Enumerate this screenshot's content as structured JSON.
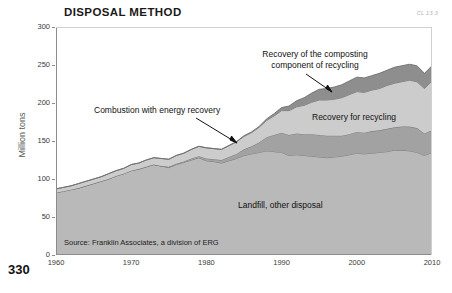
{
  "figure": {
    "title": "DISPOSAL METHOD",
    "code": "CL 13.3",
    "page_number": "330",
    "source_note": "Source: Franklin Associates, a division of ERG"
  },
  "annotations": {
    "composting_line1": "Recovery of the composting",
    "composting_line2": "component of recycling",
    "combustion": "Combustion with energy recovery",
    "recycling": "Recovery for recycling",
    "landfill": "Landfill, other disposal"
  },
  "colors": {
    "landfill": "#b9b9b9",
    "combustion": "#a2a2a2",
    "recycling": "#cccccc",
    "composting": "#8e8e8e",
    "line": "#6e6e6e",
    "axis": "#8c8c8c",
    "text": "#111111"
  },
  "chart_data": {
    "type": "area",
    "title": "DISPOSAL METHOD",
    "xlabel": "",
    "ylabel": "Million tons",
    "xlim": [
      1960,
      2010
    ],
    "ylim": [
      0,
      300
    ],
    "yticks": [
      0,
      50,
      100,
      150,
      200,
      250,
      300
    ],
    "xticks": [
      1960,
      1970,
      1980,
      1990,
      2000,
      2010
    ],
    "grid": false,
    "legend_position": "inline-annotations",
    "stacked": true,
    "x": [
      1960,
      1961,
      1962,
      1963,
      1964,
      1965,
      1966,
      1967,
      1968,
      1969,
      1970,
      1971,
      1972,
      1973,
      1974,
      1975,
      1976,
      1977,
      1978,
      1979,
      1980,
      1981,
      1982,
      1983,
      1984,
      1985,
      1986,
      1987,
      1988,
      1989,
      1990,
      1991,
      1992,
      1993,
      1994,
      1995,
      1996,
      1997,
      1998,
      1999,
      2000,
      2001,
      2002,
      2003,
      2004,
      2005,
      2006,
      2007,
      2008,
      2009,
      2010
    ],
    "series": [
      {
        "name": "Landfill, other disposal",
        "color": "#b9b9b9",
        "values": [
          82,
          84,
          86,
          88,
          91,
          94,
          97,
          100,
          104,
          107,
          111,
          113,
          116,
          119,
          117,
          115,
          119,
          122,
          125,
          128,
          124,
          123,
          121,
          124,
          127,
          131,
          133,
          135,
          137,
          136,
          135,
          131,
          132,
          131,
          130,
          129,
          128,
          129,
          130,
          132,
          134,
          133,
          134,
          135,
          136,
          138,
          138,
          137,
          135,
          131,
          135
        ]
      },
      {
        "name": "Combustion with energy recovery",
        "color": "#a2a2a2",
        "values": [
          0,
          0,
          0,
          0,
          0,
          0,
          0,
          0,
          0,
          0,
          0,
          0,
          0,
          0,
          0,
          1,
          1,
          1,
          2,
          2,
          3,
          3,
          4,
          5,
          6,
          8,
          10,
          13,
          18,
          22,
          26,
          27,
          28,
          28,
          29,
          29,
          29,
          28,
          27,
          27,
          28,
          28,
          29,
          29,
          30,
          30,
          31,
          32,
          32,
          29,
          29
        ]
      },
      {
        "name": "Recovery for recycling",
        "color": "#cccccc",
        "values": [
          5,
          5,
          5,
          6,
          6,
          6,
          6,
          7,
          7,
          7,
          8,
          8,
          9,
          9,
          10,
          10,
          11,
          11,
          12,
          13,
          14,
          14,
          14,
          15,
          16,
          17,
          18,
          20,
          22,
          25,
          29,
          32,
          35,
          38,
          42,
          46,
          47,
          48,
          50,
          52,
          53,
          53,
          54,
          55,
          57,
          58,
          59,
          61,
          61,
          59,
          65
        ]
      },
      {
        "name": "Recovery of the composting component of recycling",
        "color": "#8e8e8e",
        "values": [
          0,
          0,
          0,
          0,
          0,
          0,
          0,
          0,
          0,
          0,
          0,
          0,
          0,
          0,
          0,
          0,
          0,
          0,
          0,
          0,
          0,
          0,
          0,
          0,
          0,
          1,
          1,
          1,
          2,
          3,
          4,
          6,
          8,
          10,
          12,
          14,
          15,
          16,
          17,
          18,
          19,
          19,
          19,
          20,
          20,
          21,
          21,
          21,
          21,
          20,
          20
        ]
      }
    ],
    "totals": [
      87,
      89,
      91,
      94,
      97,
      100,
      103,
      107,
      111,
      114,
      119,
      121,
      125,
      128,
      127,
      126,
      131,
      134,
      139,
      143,
      141,
      140,
      139,
      144,
      149,
      157,
      162,
      169,
      179,
      186,
      194,
      196,
      203,
      207,
      213,
      218,
      219,
      221,
      224,
      229,
      234,
      233,
      236,
      239,
      243,
      247,
      249,
      251,
      249,
      239,
      249
    ]
  }
}
